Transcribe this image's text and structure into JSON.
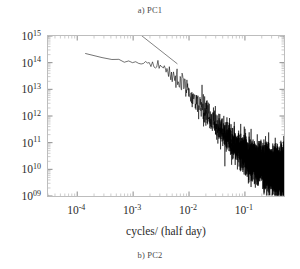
{
  "figure": {
    "caption_top": "a) PC1",
    "caption_bottom": "b) PC2"
  },
  "axes": {
    "xlabel": "cycles/ (half day)",
    "ylabel": "",
    "x_ticks": [
      {
        "value": 0.0001,
        "label_mantissa": "10",
        "label_exp": "-4"
      },
      {
        "value": 0.001,
        "label_mantissa": "10",
        "label_exp": "-3"
      },
      {
        "value": 0.01,
        "label_mantissa": "10",
        "label_exp": "-2"
      },
      {
        "value": 0.1,
        "label_mantissa": "10",
        "label_exp": "-1"
      }
    ],
    "y_ticks": [
      {
        "value": 1000000000000000.0,
        "label_mantissa": "10",
        "label_exp": "15"
      },
      {
        "value": 100000000000000.0,
        "label_mantissa": "10",
        "label_exp": "14"
      },
      {
        "value": 10000000000000.0,
        "label_mantissa": "10",
        "label_exp": "13"
      },
      {
        "value": 1000000000000.0,
        "label_mantissa": "10",
        "label_exp": "12"
      },
      {
        "value": 100000000000.0,
        "label_mantissa": "10",
        "label_exp": "11"
      },
      {
        "value": 10000000000.0,
        "label_mantissa": "10",
        "label_exp": "10"
      },
      {
        "value": 1000000000.0,
        "label_mantissa": "10",
        "label_exp": "09"
      }
    ]
  },
  "chart_data": {
    "type": "line",
    "title": "a) PC1",
    "subtitle": "b) PC2",
    "xlabel": "cycles/ (half day)",
    "ylabel": "",
    "xscale": "log",
    "yscale": "log",
    "xlim": [
      3e-05,
      0.5
    ],
    "ylim": [
      1000000000.0,
      1000000000000000.0
    ],
    "grid": false,
    "legend": null,
    "colors": {
      "spectrum": "#000000",
      "guide_line": "#555555",
      "frame": "#b9b9b9"
    },
    "series": [
      {
        "name": "power spectrum",
        "description": "Noisy red-noise power spectral density: flat ~2e14 at lowest frequencies, plateau near 1e14, power-law rolloff to ~1e10 near Nyquist",
        "x": [
          3e-05,
          5e-05,
          8e-05,
          0.00012,
          0.0002,
          0.0003,
          0.0005,
          0.0008,
          0.0012,
          0.002,
          0.003,
          0.005,
          0.008,
          0.012,
          0.02,
          0.03,
          0.05,
          0.08,
          0.12,
          0.2,
          0.3,
          0.5
        ],
        "y": [
          240000000000000.0,
          200000000000000.0,
          170000000000000.0,
          190000000000000.0,
          210000000000000.0,
          160000000000000.0,
          130000000000000.0,
          120000000000000.0,
          110000000000000.0,
          100000000000000.0,
          80000000000000.0,
          40000000000000.0,
          15000000000000.0,
          5000000000000.0,
          1400000000000.0,
          550000000000.0,
          160000000000.0,
          60000000000.0,
          30000000000.0,
          18000000000.0,
          12000000000.0,
          10000000000.0
        ],
        "noise_scatter_decades": 0.55
      },
      {
        "name": "guide line",
        "description": "Straight reference slope line drawn over the rolloff region",
        "x": [
          0.0014,
          0.0062
        ],
        "y": [
          1050000000000000.0,
          90000000000000.0
        ]
      }
    ]
  }
}
